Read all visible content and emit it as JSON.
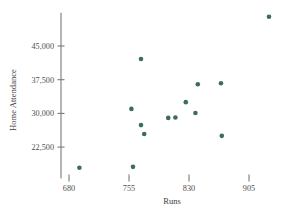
{
  "chart_data": {
    "type": "scatter",
    "title": "",
    "xlabel": "Runs",
    "ylabel": "Home Attendance",
    "xlim": [
      665,
      945
    ],
    "ylim": [
      15000,
      54000
    ],
    "xticks": [
      680,
      755,
      830,
      905
    ],
    "xtick_labels": [
      "680",
      "755",
      "830",
      "905"
    ],
    "yticks": [
      22500,
      30000,
      37500,
      45000
    ],
    "ytick_labels": [
      "22,500",
      "30,000",
      "37,500",
      "45,000"
    ],
    "grid": false,
    "legend": false,
    "marker_color": "#3c6c60",
    "marker_size": 4.6,
    "axis_color": "#7a7a7a",
    "points": [
      {
        "x": 693,
        "y": 17900
      },
      {
        "x": 760,
        "y": 18100
      },
      {
        "x": 758,
        "y": 31000
      },
      {
        "x": 770,
        "y": 42100
      },
      {
        "x": 770,
        "y": 27400
      },
      {
        "x": 774,
        "y": 25400
      },
      {
        "x": 804,
        "y": 29000
      },
      {
        "x": 813,
        "y": 29100
      },
      {
        "x": 826,
        "y": 32500
      },
      {
        "x": 838,
        "y": 30100
      },
      {
        "x": 841,
        "y": 36500
      },
      {
        "x": 870,
        "y": 36700
      },
      {
        "x": 871,
        "y": 25000
      },
      {
        "x": 930,
        "y": 51500
      }
    ]
  },
  "axes": {
    "x_axis_name": "runs-axis",
    "y_axis_name": "home-attendance-axis"
  }
}
